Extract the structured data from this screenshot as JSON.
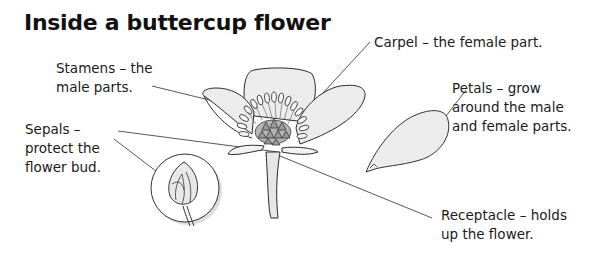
{
  "diagram": {
    "title": "Inside a buttercup flower",
    "labels": {
      "carpel": {
        "lines": [
          "Carpel – the female part."
        ]
      },
      "stamens": {
        "lines": [
          "Stamens – the",
          "male parts."
        ]
      },
      "sepals": {
        "lines": [
          "Sepals –",
          "protect the",
          "flower bud."
        ]
      },
      "petals": {
        "lines": [
          "Petals – grow",
          "around the male",
          "and female parts."
        ]
      },
      "receptacle": {
        "lines": [
          "Receptacle – holds",
          "up the flower."
        ]
      }
    },
    "icons": [
      "buttercup-flower-illustration",
      "flower-bud-inset",
      "detached-petal-illustration"
    ],
    "colors": {
      "line": "#333333",
      "fill": "#ececec",
      "text": "#1a1a1a"
    }
  }
}
